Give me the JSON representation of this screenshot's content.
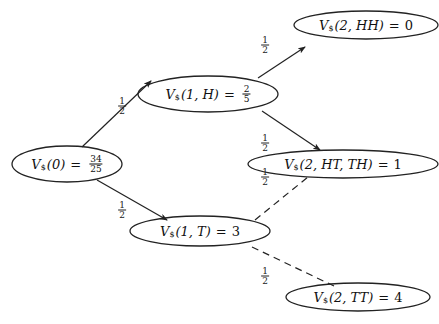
{
  "diagram": {
    "type": "binomial-tree",
    "nodes": [
      {
        "id": "root",
        "symbol": "V",
        "subscript": "$",
        "args": "(0)",
        "equals": "=",
        "value_num": "34",
        "value_den": "25",
        "cx": 67,
        "cy": 164,
        "rx": 55,
        "ry": 18
      },
      {
        "id": "H1",
        "symbol": "V",
        "subscript": "$",
        "args": "(1, H)",
        "equals": "=",
        "value_num": "2",
        "value_den": "5",
        "cx": 208,
        "cy": 94,
        "rx": 70,
        "ry": 18
      },
      {
        "id": "T1",
        "symbol": "V",
        "subscript": "$",
        "args": "(1, T)",
        "equals": "=",
        "value": "3",
        "cx": 200,
        "cy": 231,
        "rx": 70,
        "ry": 15
      },
      {
        "id": "HH2",
        "symbol": "V",
        "subscript": "$",
        "args": "(2, HH)",
        "equals": "=",
        "value": "0",
        "cx": 366,
        "cy": 25,
        "rx": 72,
        "ry": 14
      },
      {
        "id": "HTTH2",
        "symbol": "V",
        "subscript": "$",
        "args": "(2, HT, TH)",
        "equals": "=",
        "value": "1",
        "cx": 343,
        "cy": 164,
        "rx": 95,
        "ry": 14
      },
      {
        "id": "TT2",
        "symbol": "V",
        "subscript": "$",
        "args": "(2, TT)",
        "equals": "=",
        "value": "4",
        "cx": 358,
        "cy": 297,
        "rx": 72,
        "ry": 14
      }
    ],
    "edges": [
      {
        "from": "root",
        "to": "H1",
        "style": "solid",
        "arrow": true,
        "x1": 82,
        "y1": 147,
        "x2": 151,
        "y2": 81,
        "prob_num": "1",
        "prob_den": "2",
        "lx": 122,
        "ly": 106
      },
      {
        "from": "root",
        "to": "T1",
        "style": "solid",
        "arrow": true,
        "x1": 97,
        "y1": 180,
        "x2": 167,
        "y2": 220,
        "prob_num": "1",
        "prob_den": "2",
        "lx": 122,
        "ly": 210
      },
      {
        "from": "H1",
        "to": "HH2",
        "style": "solid",
        "arrow": true,
        "x1": 258,
        "y1": 78,
        "x2": 305,
        "y2": 47,
        "prob_num": "1",
        "prob_den": "2",
        "lx": 265,
        "ly": 45
      },
      {
        "from": "H1",
        "to": "HTTH2",
        "style": "solid",
        "arrow": true,
        "x1": 262,
        "y1": 111,
        "x2": 320,
        "y2": 150,
        "prob_num": "1",
        "prob_den": "2",
        "lx": 265,
        "ly": 143
      },
      {
        "from": "T1",
        "to": "HTTH2",
        "style": "dashed",
        "arrow": false,
        "x1": 255,
        "y1": 220,
        "x2": 308,
        "y2": 177,
        "prob_num": "1",
        "prob_den": "2",
        "lx": 265,
        "ly": 177
      },
      {
        "from": "T1",
        "to": "TT2",
        "style": "dashed",
        "arrow": false,
        "x1": 252,
        "y1": 247,
        "x2": 334,
        "y2": 286,
        "prob_num": "1",
        "prob_den": "2",
        "lx": 265,
        "ly": 276
      }
    ],
    "colors": {
      "stroke": "#222222",
      "text": "#111111",
      "background": "#ffffff"
    }
  }
}
